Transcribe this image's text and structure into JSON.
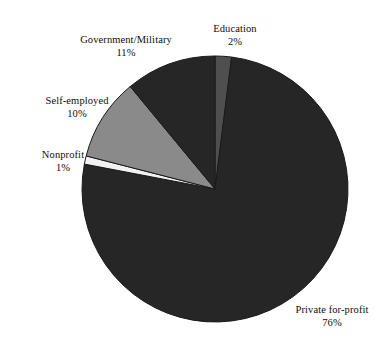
{
  "chart_data": {
    "type": "pie",
    "title": "",
    "subtitle": "",
    "xlabel": "",
    "ylabel": "",
    "grid": false,
    "legend_position": "none",
    "label_format": "name + percent outside slice",
    "start_angle_deg": 0,
    "direction": "clockwise",
    "categories": [
      "Education",
      "Private for-profit",
      "Nonprofit",
      "Self-employed",
      "Government/Military"
    ],
    "values": [
      2,
      76,
      1,
      10,
      11
    ],
    "units": "percent",
    "total": 100,
    "slices": [
      {
        "name": "Education",
        "value": 2,
        "percent_label": "2%",
        "color": "#4f4f4f",
        "start_deg": 0,
        "end_deg": 7.2
      },
      {
        "name": "Private for-profit",
        "value": 76,
        "percent_label": "76%",
        "color": "#262626",
        "start_deg": 7.2,
        "end_deg": 280.8
      },
      {
        "name": "Nonprofit",
        "value": 1,
        "percent_label": "1%",
        "color": "#f2f2f2",
        "start_deg": 280.8,
        "end_deg": 284.4
      },
      {
        "name": "Self-employed",
        "value": 10,
        "percent_label": "10%",
        "color": "#8a8a8a",
        "start_deg": 284.4,
        "end_deg": 320.4
      },
      {
        "name": "Government/Military",
        "value": 11,
        "percent_label": "11%",
        "color": "#262626",
        "start_deg": 320.4,
        "end_deg": 360
      }
    ]
  },
  "labels": {
    "education": {
      "name": "Education",
      "percent": "2%"
    },
    "private": {
      "name": "Private for-profit",
      "percent": "76%"
    },
    "nonprofit": {
      "name": "Nonprofit",
      "percent": "1%"
    },
    "selfemployed": {
      "name": "Self-employed",
      "percent": "10%"
    },
    "government": {
      "name": "Government/Military",
      "percent": "11%"
    }
  },
  "geometry": {
    "center_x": 215,
    "center_y": 189,
    "radius": 133
  },
  "colors": {
    "background": "#ffffff",
    "text": "#0d0d0d",
    "dark_slice": "#262626",
    "mid_dark_slice": "#4f4f4f",
    "mid_slice": "#8a8a8a",
    "light_slice": "#f2f2f2",
    "slice_outline": "#1a1a1a"
  }
}
